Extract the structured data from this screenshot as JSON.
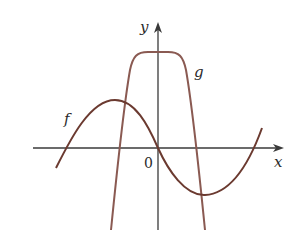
{
  "figure": {
    "axes": {
      "x_label": "x",
      "y_label": "y",
      "origin_label": "0",
      "axis_color": "#3a3a3a"
    },
    "curves": [
      {
        "name": "f",
        "label": "f",
        "color": "#6b3a30",
        "description": "sine-like cubic curve passing through origin, local max on left, local min on right"
      },
      {
        "name": "g",
        "label": "g",
        "color": "#8a5a52",
        "description": "flat-topped curve with plateau above origin, steeply decreasing on both sides"
      }
    ]
  }
}
